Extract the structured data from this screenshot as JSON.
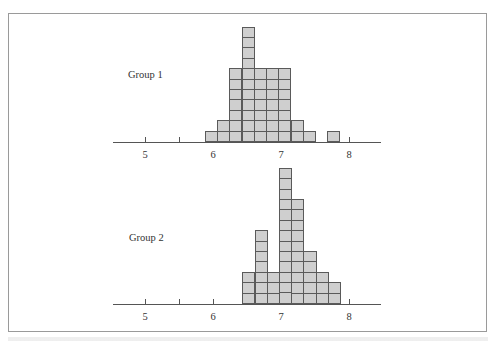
{
  "chart_data": {
    "type": "bar",
    "subtype": "dot-histogram (stacked unit squares)",
    "title": "",
    "xlabel": "",
    "ylabel": "",
    "xlim": [
      4.6,
      8.5
    ],
    "x_ticks": [
      5,
      5.5,
      6,
      6.5,
      7,
      7.5,
      8
    ],
    "x_tick_labels": [
      "5",
      "",
      "6",
      "",
      "7",
      "",
      "8"
    ],
    "bin_width": 0.18,
    "grid": false,
    "legend": null,
    "series": [
      {
        "name": "Group 1",
        "bin_starts": [
          5.88,
          6.06,
          6.24,
          6.42,
          6.6,
          6.78,
          6.96,
          7.14,
          7.32,
          7.5,
          7.68
        ],
        "values": [
          1,
          2,
          7,
          11,
          7,
          7,
          7,
          2,
          1,
          0,
          1
        ],
        "total": 46
      },
      {
        "name": "Group 2",
        "bin_starts": [
          6.43,
          6.61,
          6.79,
          6.97,
          7.15,
          7.33,
          7.51,
          7.69
        ],
        "values": [
          3,
          7,
          3,
          13,
          10,
          5,
          3,
          2
        ],
        "total": 46
      }
    ]
  },
  "panels": [
    {
      "label": "Group 1"
    },
    {
      "label": "Group 2"
    }
  ],
  "axis": {
    "tick_labels": [
      "5",
      "6",
      "7",
      "8"
    ]
  },
  "colors": {
    "cell_fill": "#cfcfcf",
    "cell_border": "#5a5a5a",
    "axis": "#555555",
    "frame": "#9a9a9a"
  }
}
